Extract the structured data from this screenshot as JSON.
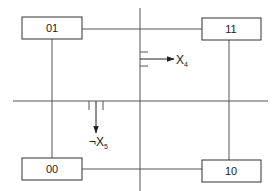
{
  "diagram": {
    "type": "state-transition (Karnaugh-style quadrant)",
    "states": [
      {
        "id": "01",
        "label": "01",
        "x": 22,
        "y": 17,
        "w": 60,
        "h": 22
      },
      {
        "id": "11",
        "label": "11",
        "x": 202,
        "y": 18,
        "w": 59,
        "h": 22
      },
      {
        "id": "00",
        "label": "00",
        "x": 22,
        "y": 158,
        "w": 60,
        "h": 22
      },
      {
        "id": "10",
        "label": "10",
        "x": 202,
        "y": 160,
        "w": 59,
        "h": 22
      }
    ],
    "arrows": [
      {
        "id": "x4",
        "label_main": "X",
        "label_sub": "4",
        "label_prefix": "",
        "direction": "right"
      },
      {
        "id": "x5",
        "label_main": "X",
        "label_sub": "5",
        "label_prefix": "¬",
        "direction": "down"
      }
    ],
    "colors": {
      "line": "#444444",
      "box_stroke": "#333333",
      "background": "#ffffff"
    }
  }
}
